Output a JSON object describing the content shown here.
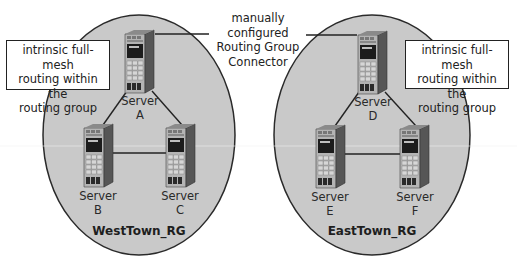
{
  "diagram": {
    "connector_label": [
      "manually configured",
      "Routing Group",
      "Connector"
    ],
    "routing_groups": [
      {
        "name": "WestTown_RG",
        "callout": [
          "intrinsic full-mesh",
          "routing within the",
          "routing group"
        ],
        "servers": [
          {
            "label": "Server",
            "id": "A"
          },
          {
            "label": "Server",
            "id": "B"
          },
          {
            "label": "Server",
            "id": "C"
          }
        ]
      },
      {
        "name": "EastTown_RG",
        "callout": [
          "intrinsic full-mesh",
          "routing within the",
          "routing group"
        ],
        "servers": [
          {
            "label": "Server",
            "id": "D"
          },
          {
            "label": "Server",
            "id": "E"
          },
          {
            "label": "Server",
            "id": "F"
          }
        ]
      }
    ],
    "links": [
      [
        "A",
        "B"
      ],
      [
        "A",
        "C"
      ],
      [
        "B",
        "C"
      ],
      [
        "D",
        "E"
      ],
      [
        "D",
        "F"
      ],
      [
        "E",
        "F"
      ],
      [
        "A",
        "D"
      ]
    ],
    "colors": {
      "group_fill": "#c9c9c9",
      "outline": "#2a2a2a",
      "server_front": "#b8b8b8",
      "server_side": "#5a5a5a",
      "server_screen": "#1a1a1a",
      "callout_bg": "#ffffff"
    },
    "icons": {
      "server": "server-tower-icon"
    }
  }
}
